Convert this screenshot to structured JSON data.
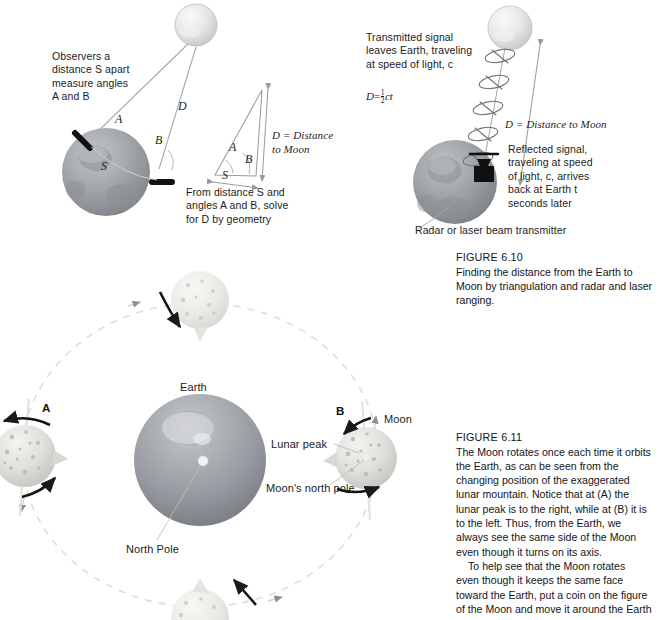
{
  "figure_610": {
    "triangulation": {
      "observers_note": "Observers a\ndistance S apart\nmeasure angles\nA and B",
      "angle_a": "A",
      "angle_b": "B",
      "distance_d": "D",
      "baseline_s": "S",
      "geometry_note": "From distance S and\nangles A and B, solve\nfor D by geometry",
      "triangle": {
        "angle_a": "A",
        "angle_b": "B",
        "side_s": "S",
        "d_label": "D = Distance\nto Moon"
      }
    },
    "radar": {
      "transmitted_note": "Transmitted signal\nleaves Earth, traveling\nat speed of light, c",
      "formula_lead": "D",
      "formula_eq": "=",
      "formula_num": "1",
      "formula_den": "2",
      "formula_tail": "ct",
      "distance_label": "D = Distance to Moon",
      "reflected_note": "Reflected signal,\ntraveling at speed\nof light, c, arrives\nback at Earth t\nseconds later",
      "transmitter_label": "Radar or laser beam transmitter"
    },
    "caption": {
      "title": "FIGURE 6.10",
      "body": "Finding the distance from the Earth to\nMoon by triangulation and radar and laser\nranging."
    }
  },
  "figure_611": {
    "diagram": {
      "earth_label": "Earth",
      "north_pole_label": "North Pole",
      "moon_label": "Moon",
      "lunar_peak_label": "Lunar peak",
      "moons_north_pole_label": "Moon's north pole",
      "position_a": "A",
      "position_b": "B"
    },
    "caption": {
      "title": "FIGURE 6.11",
      "paragraph1": "The Moon rotates once each time it orbits\nthe Earth, as can be seen from the\nchanging position of the exaggerated\nlunar mountain. Notice that at (A) the\nlunar peak is to the right, while at (B) it is\nto the left. Thus, from the Earth, we\nalways see the same side of the Moon\neven though it turns on its axis.",
      "paragraph2": "To help see that the Moon rotates\neven though it keeps the same face\ntoward the Earth, put a coin on the figure\nof the Moon and move it around the Earth"
    }
  },
  "colors": {
    "earth_dark": "#8e9196",
    "earth_mid": "#a8abb0",
    "moon_light": "#dcdcdc",
    "text": "#1b1b22",
    "line": "#b9b9bd",
    "arrow_dark": "#161616",
    "orbit_dash": "#d9d9d9"
  }
}
